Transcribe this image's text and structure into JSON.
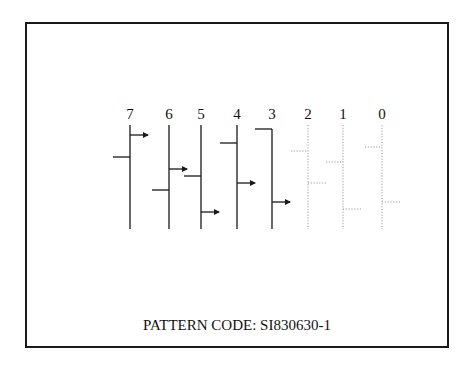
{
  "diagram": {
    "caption": "PATTERN CODE:  SI830630-1",
    "colors": {
      "solid": "#1a1a1a",
      "dotted": "#9a9a9a",
      "border": "#1a1a1a"
    },
    "channels": [
      {
        "label": "7",
        "style": "solid",
        "x": 130,
        "top": 125,
        "left_tick_y": 157,
        "right_arrow_y": 135
      },
      {
        "label": "6",
        "style": "solid",
        "x": 169,
        "top": 125,
        "left_tick_y": 190,
        "right_arrow_y": 169
      },
      {
        "label": "5",
        "style": "solid",
        "x": 201,
        "top": 125,
        "left_tick_y": 176,
        "right_arrow_y": 212
      },
      {
        "label": "4",
        "style": "solid",
        "x": 237,
        "top": 125,
        "left_tick_y": 143,
        "right_arrow_y": 183
      },
      {
        "label": "3",
        "style": "solid",
        "x": 272,
        "top": 129,
        "left_tick_y": 129,
        "right_arrow_y": 202
      },
      {
        "label": "2",
        "style": "dotted",
        "x": 308,
        "top": 125,
        "left_tick_y": 151,
        "right_arrow_y": 183
      },
      {
        "label": "1",
        "style": "dotted",
        "x": 343,
        "top": 125,
        "left_tick_y": 162,
        "right_arrow_y": 209
      },
      {
        "label": "0",
        "style": "dotted",
        "x": 382,
        "top": 125,
        "left_tick_y": 147,
        "right_arrow_y": 202
      }
    ]
  }
}
